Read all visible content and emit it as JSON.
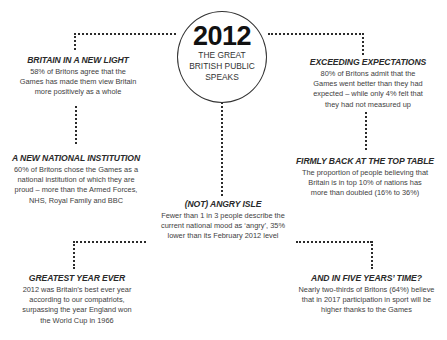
{
  "center": {
    "year": "2012",
    "subtitle_lines": [
      "THE GREAT",
      "BRITISH PUBLIC",
      "SPEAKS"
    ]
  },
  "facts": [
    {
      "title": "BRITAIN IN A NEW LIGHT",
      "lines": [
        "58% of Britons agree that the",
        "Games has made them view Britain",
        "more positively as a whole"
      ]
    },
    {
      "title": "EXCEEDING EXPECTATIONS",
      "lines": [
        "80% of Britons admit that the",
        "Games went better than they had",
        "expected – while only 4% felt that",
        "they had not measured up"
      ]
    },
    {
      "title": "A NEW NATIONAL INSTITUTION",
      "lines": [
        "60% of Britons chose the Games as a",
        "national institution of which they are",
        "proud – more than the Armed Forces,",
        "NHS, Royal Family and BBC"
      ]
    },
    {
      "title": "FIRMLY BACK AT THE TOP TABLE",
      "lines": [
        "The proportion of people believing that",
        "Britain is in top 10% of nations has",
        "more than doubled (16% to 36%)"
      ]
    },
    {
      "title": "(NOT) ANGRY ISLE",
      "lines": [
        "Fewer than 1 in 3 people describe the",
        "current national mood as ‘angry’, 35%",
        "lower than its February 2012 level"
      ]
    },
    {
      "title": "GREATEST YEAR EVER",
      "lines": [
        "2012 was Britain’s best ever year",
        "according to our compatriots,",
        "surpassing the year England won",
        "the World Cup in 1966"
      ]
    },
    {
      "title": "AND IN FIVE YEARS’ TIME?",
      "lines": [
        "Nearly two-thirds of Britons (64%) believe",
        "that in 2017 participation in sport will be",
        "higher thanks to the Games"
      ]
    }
  ]
}
